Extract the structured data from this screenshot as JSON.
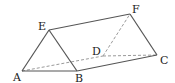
{
  "diagram": {
    "type": "triangular-prism",
    "vertices": {
      "A": {
        "label": "A",
        "x": 22,
        "y": 71,
        "lx": 13,
        "ly": 81
      },
      "B": {
        "label": "B",
        "x": 77,
        "y": 71,
        "lx": 75,
        "ly": 82
      },
      "C": {
        "label": "C",
        "x": 157,
        "y": 55,
        "lx": 160,
        "ly": 64
      },
      "D": {
        "label": "D",
        "x": 103,
        "y": 56,
        "lx": 92,
        "ly": 55
      },
      "E": {
        "label": "E",
        "x": 49,
        "y": 30,
        "lx": 38,
        "ly": 30
      },
      "F": {
        "label": "F",
        "x": 130,
        "y": 14,
        "lx": 132,
        "ly": 13
      }
    },
    "solid_edges": [
      [
        "A",
        "B"
      ],
      [
        "A",
        "E"
      ],
      [
        "E",
        "B"
      ],
      [
        "E",
        "F"
      ],
      [
        "F",
        "C"
      ],
      [
        "B",
        "C"
      ]
    ],
    "dashed_edges": [
      [
        "A",
        "D"
      ],
      [
        "D",
        "C"
      ],
      [
        "D",
        "F"
      ]
    ],
    "colors": {
      "solid": "#555555",
      "dashed": "#9a9a9a",
      "label": "#222222"
    }
  }
}
